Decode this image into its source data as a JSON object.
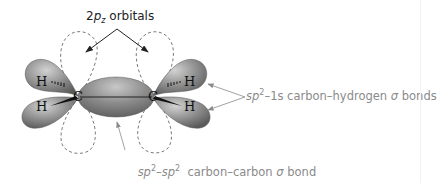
{
  "diagram": {
    "labels": {
      "p_orbitals": {
        "prefix": "2",
        "italic": "p",
        "subscript": "z",
        "suffix": " orbitals"
      },
      "ch_bonds": {
        "sp": "sp",
        "sup": "2",
        "rest": "–1s carbon–hydrogen ",
        "sigma": "σ",
        "end": " bonds"
      },
      "cc_bond": {
        "sp1": "sp",
        "sup1": "2",
        "dash": "–",
        "sp2": "sp",
        "sup2": "2",
        "rest": "  carbon–carbon ",
        "sigma": "σ",
        "end": " bond"
      }
    },
    "atoms": {
      "carbon_left": "C",
      "carbon_right": "C",
      "hydrogen_top_left": "H",
      "hydrogen_bottom_left": "H",
      "hydrogen_top_right": "H",
      "hydrogen_bottom_right": "H"
    },
    "colors": {
      "lobe_fill": "#8f8f8f",
      "lobe_highlight": "#c9c9c9",
      "lobe_dark": "#5e5e5e",
      "dashed_outline": "#7a7a7a",
      "label_grey": "#8a8a8a",
      "label_dark": "#222222"
    }
  }
}
